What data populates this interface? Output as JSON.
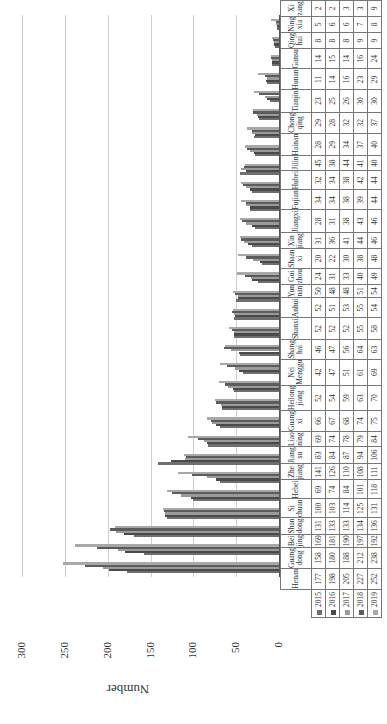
{
  "chart_data": {
    "type": "bar",
    "title": "",
    "xlabel": "",
    "ylabel": "Number",
    "ylim": [
      0,
      300
    ],
    "yticks": [
      0,
      50,
      100,
      150,
      200,
      250,
      300
    ],
    "grid": true,
    "legend_position": "data-table",
    "orientation_note": "figure rotated 90 degrees counter-clockwise",
    "categories": [
      "Henan",
      "Guangdong",
      "Beijing",
      "Shandong",
      "Sichuan",
      "Hebei",
      "Zhejiang",
      "Jiangsu",
      "Liaoning",
      "Guangxi",
      "Heilongjiang",
      "Nei Menggu",
      "Shanghai",
      "Shanxi",
      "Anhui",
      "Yunnan",
      "Guizhou",
      "Shaanxi",
      "Xinjiang",
      "Jiangxi",
      "Fujian",
      "Hubei",
      "Jilin",
      "Hainan",
      "Chongqing",
      "Tianjin",
      "Hunan",
      "Gansu",
      "Qinghai",
      "Ningxia",
      "Xizang"
    ],
    "category_labels": [
      "Henan",
      "Guang dong",
      "Bei jing",
      "Shan dong",
      "Si chuan",
      "Hebei",
      "Zhe jiang",
      "Jiang su",
      "Liao ning",
      "Guang xi",
      "Heilong jiang",
      "Nei Menggu",
      "Shang hai",
      "Shanxi",
      "Anhui",
      "Yun nan",
      "Gui zhou",
      "Shaan xi",
      "Xin jiang",
      "Jiangxi",
      "Fujian",
      "Hubei",
      "Jilin",
      "Hainan",
      "Chong qing",
      "Tianjin",
      "Hunan",
      "Gansu",
      "Qing hai",
      "Ning xia",
      "Xi zang"
    ],
    "series": [
      {
        "name": "2015",
        "color": "#6e6e6e",
        "values": [
          177,
          158,
          169,
          131,
          100,
          69,
          141,
          83,
          69,
          66,
          52,
          42,
          46,
          52,
          52,
          50,
          24,
          20,
          31,
          28,
          34,
          32,
          45,
          28,
          29,
          23,
          11,
          14,
          8,
          5,
          2
        ]
      },
      {
        "name": "2016",
        "color": "#4a4a4a",
        "values": [
          198,
          180,
          181,
          133,
          103,
          74,
          126,
          84,
          74,
          67,
          54,
          47,
          47,
          52,
          51,
          48,
          31,
          22,
          36,
          31,
          34,
          34,
          38,
          29,
          28,
          25,
          14,
          15,
          8,
          6,
          2
        ]
      },
      {
        "name": "2017",
        "color": "#9a9a9a",
        "values": [
          205,
          188,
          190,
          133,
          114,
          84,
          110,
          87,
          78,
          68,
          59,
          51,
          56,
          52,
          53,
          48,
          33,
          30,
          41,
          38,
          38,
          38,
          44,
          34,
          32,
          26,
          16,
          14,
          8,
          6,
          3
        ]
      },
      {
        "name": "2018",
        "color": "#5c5c5c",
        "values": [
          227,
          212,
          197,
          134,
          125,
          101,
          108,
          94,
          79,
          74,
          63,
          61,
          64,
          55,
          55,
          51,
          40,
          38,
          44,
          43,
          39,
          42,
          41,
          37,
          32,
          30,
          23,
          16,
          9,
          7,
          3
        ]
      },
      {
        "name": "2019",
        "color": "#a8a8a8",
        "values": [
          252,
          238,
          192,
          136,
          131,
          118,
          111,
          106,
          84,
          75,
          70,
          69,
          63,
          58,
          54,
          54,
          49,
          48,
          46,
          46,
          44,
          44,
          40,
          40,
          37,
          30,
          29,
          24,
          9,
          8,
          9
        ]
      }
    ]
  }
}
